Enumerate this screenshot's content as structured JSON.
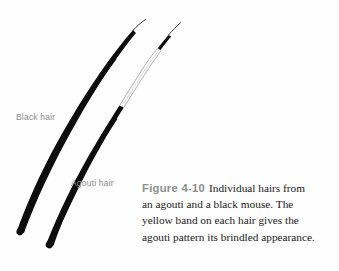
{
  "figure": {
    "number_label": "Figure 4-10",
    "caption_lines": [
      "Individual hairs from",
      "an agouti and a black mouse. The",
      "yellow band on each hair gives the",
      "agouti pattern its brindled appearance."
    ],
    "caption_full": "Figure 4-10 Individual hairs from an agouti and a black mouse. The yellow band on each hair gives the agouti pattern its brindled appearance."
  },
  "labels": {
    "black_hair": "Black hair",
    "agouti_hair": "Agouti hair"
  },
  "illustration": {
    "name": "two-hair-shafts-diagram",
    "background_color": "#fefefe",
    "hairs": [
      {
        "id": "black-hair",
        "label": "Black hair",
        "description": "Uniformly black hair shaft, thick at base tapering to a fine tip",
        "band": "none",
        "shaft_color": "#0d0d0d",
        "tip_color": "#0d0d0d"
      },
      {
        "id": "agouti-hair",
        "label": "Agouti hair",
        "description": "Black hair shaft with a pale yellow band near the tip and a black tip",
        "band": "yellow-band",
        "shaft_color": "#0d0d0d",
        "band_color": "#ffffff",
        "band_outline_color": "#9a9a9a",
        "tip_color": "#0d0d0d"
      }
    ],
    "colors": {
      "hair_black": "#0d0d0d",
      "band_outline": "#9a9a9a",
      "label_gray": "#8a8a8a",
      "figure_number_gray": "#8d8d8d",
      "caption_text": "#1a1a1a"
    }
  }
}
